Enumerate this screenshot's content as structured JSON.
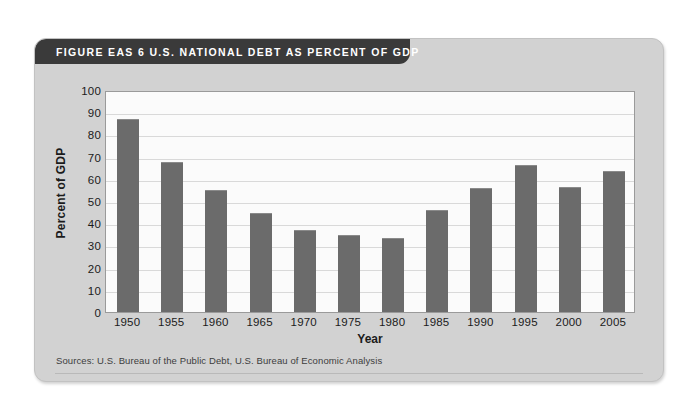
{
  "figure": {
    "title": "FIGURE EAS 6   U.S. NATIONAL DEBT AS PERCENT OF GDP",
    "source_note": "Sources: U.S. Bureau of the Public Debt, U.S. Bureau of Economic Analysis"
  },
  "colors": {
    "card_background": "#d2d2d2",
    "title_bar": "#3a3a3a",
    "title_text": "#ffffff",
    "bar_fill": "#6b6b6b",
    "plot_background": "#fbfbfb",
    "gridline": "#d9d9d9",
    "axis_line": "#9a9a9a",
    "page_background": "#ffffff"
  },
  "chart_data": {
    "type": "bar",
    "title": "U.S. NATIONAL DEBT AS PERCENT OF GDP",
    "xlabel": "Year",
    "ylabel": "Percent of GDP",
    "categories": [
      "1950",
      "1955",
      "1960",
      "1965",
      "1970",
      "1975",
      "1980",
      "1985",
      "1990",
      "1995",
      "2000",
      "2005"
    ],
    "values": [
      87,
      67.5,
      55,
      44.5,
      37,
      34.8,
      33.5,
      46,
      55.8,
      66.3,
      56.3,
      63.5
    ],
    "ylim": [
      0,
      100
    ],
    "ytick_step": 10,
    "ytick_labels": [
      "100",
      "90",
      "80",
      "70",
      "60",
      "50",
      "40",
      "30",
      "20",
      "10",
      "0"
    ],
    "grid": true,
    "grid_axis": "y",
    "legend": false,
    "legend_position": "none"
  }
}
